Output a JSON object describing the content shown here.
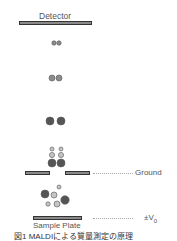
{
  "diagram": {
    "type": "MALDI time-of-flight mass measurement principle",
    "detector": {
      "label": "Detector"
    },
    "ground": {
      "label": "Ground"
    },
    "sample_plate": {
      "label": "Sample Plate",
      "voltage_label": "±V",
      "voltage_subscript": "0"
    },
    "caption": "図1 MALDIによる質量測定の原理",
    "colors": {
      "bar_fill": "#8a8a8a",
      "bar_border": "#333333",
      "particle_dark": "#555555",
      "particle_mid": "#8c8c8c",
      "particle_light": "#c4c4c4",
      "dashed_line": "#aaaaaa"
    },
    "particles": [
      {
        "group": "tiny-pair",
        "cx": 54,
        "cy": 43,
        "r": 2.2,
        "shade": "mid"
      },
      {
        "group": "tiny-pair",
        "cx": 59,
        "cy": 43,
        "r": 2.2,
        "shade": "mid"
      },
      {
        "group": "small-pair",
        "cx": 52,
        "cy": 78,
        "r": 3,
        "shade": "mid"
      },
      {
        "group": "small-pair",
        "cx": 59,
        "cy": 78,
        "r": 3,
        "shade": "mid"
      },
      {
        "group": "large-pair",
        "cx": 50,
        "cy": 121,
        "r": 4,
        "shade": "dark"
      },
      {
        "group": "large-pair",
        "cx": 61,
        "cy": 121,
        "r": 4,
        "shade": "dark"
      },
      {
        "group": "stack-left",
        "cx": 52,
        "cy": 149,
        "r": 2,
        "shade": "light"
      },
      {
        "group": "stack-left",
        "cx": 52,
        "cy": 155,
        "r": 2.6,
        "shade": "light"
      },
      {
        "group": "stack-left",
        "cx": 52,
        "cy": 163,
        "r": 4,
        "shade": "dark"
      },
      {
        "group": "stack-right",
        "cx": 61,
        "cy": 149,
        "r": 2,
        "shade": "light"
      },
      {
        "group": "stack-right",
        "cx": 61,
        "cy": 155,
        "r": 2.6,
        "shade": "light"
      },
      {
        "group": "stack-right",
        "cx": 61,
        "cy": 163,
        "r": 4,
        "shade": "dark"
      },
      {
        "group": "scatter",
        "cx": 59,
        "cy": 187,
        "r": 2,
        "shade": "light"
      },
      {
        "group": "scatter",
        "cx": 45,
        "cy": 194,
        "r": 4,
        "shade": "dark"
      },
      {
        "group": "scatter",
        "cx": 54,
        "cy": 195,
        "r": 3,
        "shade": "light"
      },
      {
        "group": "scatter",
        "cx": 65,
        "cy": 200,
        "r": 4.2,
        "shade": "dark"
      },
      {
        "group": "scatter",
        "cx": 48,
        "cy": 204,
        "r": 2.2,
        "shade": "light"
      },
      {
        "group": "scatter",
        "cx": 57,
        "cy": 204,
        "r": 3,
        "shade": "light"
      }
    ]
  }
}
